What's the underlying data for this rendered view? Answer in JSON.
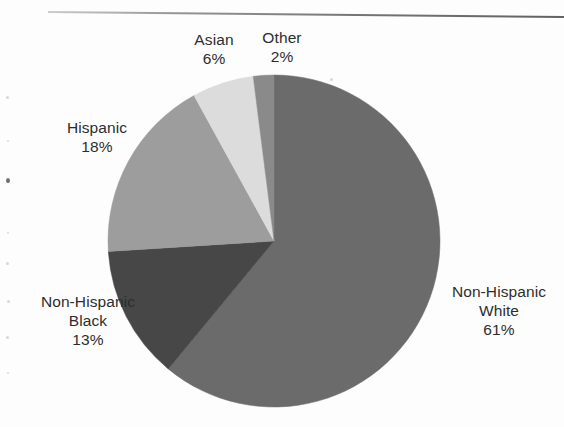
{
  "document": {
    "background_color": "#fdfdfd",
    "rule_color": "#6e6e6e"
  },
  "chart_data": {
    "type": "pie",
    "title": "",
    "subtitle": "",
    "xlabel": "",
    "ylabel": "",
    "legend_position": "none",
    "grid": false,
    "labels_show_percent": true,
    "start_angle_deg": 0,
    "direction": "clockwise",
    "categories": [
      "Non-Hispanic White",
      "Non-Hispanic Black",
      "Hispanic",
      "Asian",
      "Other"
    ],
    "values": [
      61,
      13,
      18,
      6,
      2
    ],
    "units": "percent",
    "total": 100,
    "colors": [
      "#6b6b6b",
      "#474747",
      "#9d9d9d",
      "#dcdcdc",
      "#8a8a8a"
    ],
    "slices": [
      {
        "name": "Non-Hispanic White",
        "label_line1": "Non-Hispanic",
        "label_line2": "White",
        "value": 61,
        "percent_text": "61%",
        "color": "#6b6b6b",
        "start_deg": 0,
        "end_deg": 219.6
      },
      {
        "name": "Non-Hispanic Black",
        "label_line1": "Non-Hispanic",
        "label_line2": "Black",
        "value": 13,
        "percent_text": "13%",
        "color": "#474747",
        "start_deg": 219.6,
        "end_deg": 266.4
      },
      {
        "name": "Hispanic",
        "label_line1": "Hispanic",
        "label_line2": "",
        "value": 18,
        "percent_text": "18%",
        "color": "#9d9d9d",
        "start_deg": 266.4,
        "end_deg": 331.2
      },
      {
        "name": "Asian",
        "label_line1": "Asian",
        "label_line2": "",
        "value": 6,
        "percent_text": "6%",
        "color": "#dcdcdc",
        "start_deg": 331.2,
        "end_deg": 352.8
      },
      {
        "name": "Other",
        "label_line1": "Other",
        "label_line2": "",
        "value": 2,
        "percent_text": "2%",
        "color": "#8a8a8a",
        "start_deg": 352.8,
        "end_deg": 360
      }
    ],
    "geometry": {
      "center_x": 274,
      "center_y": 241,
      "radius": 166
    }
  }
}
